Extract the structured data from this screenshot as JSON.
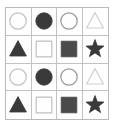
{
  "figure": {
    "name": "shape-grid",
    "rows": 4,
    "columns": 4,
    "background_color": "#fefefe",
    "border_color": "#b9b9b9",
    "gridline_color": "#c2c2c2"
  },
  "palette": {
    "dark_fill": "#3a3a3a",
    "medium_fill": "#4a4a4a",
    "light_outline": "#c0c0c0",
    "medium_outline": "#9a9a9a",
    "very_light_outline": "#cfcfcf"
  },
  "chart_data": {
    "type": "table",
    "title": "",
    "rows": 4,
    "columns": 4,
    "cells": [
      [
        {
          "shape": "circle",
          "style": "outline",
          "color": "#c0c0c0",
          "icon": "circle-outline-icon"
        },
        {
          "shape": "circle",
          "style": "filled",
          "color": "#3a3a3a",
          "icon": "circle-filled-icon"
        },
        {
          "shape": "circle",
          "style": "outline",
          "color": "#9a9a9a",
          "icon": "circle-ring-icon"
        },
        {
          "shape": "triangle",
          "style": "outline",
          "color": "#cfcfcf",
          "icon": "triangle-outline-icon"
        }
      ],
      [
        {
          "shape": "triangle",
          "style": "filled",
          "color": "#3a3a3a",
          "icon": "triangle-filled-icon"
        },
        {
          "shape": "square",
          "style": "outline",
          "color": "#c0c0c0",
          "icon": "square-outline-icon"
        },
        {
          "shape": "square",
          "style": "filled",
          "color": "#4a4a4a",
          "icon": "square-filled-icon"
        },
        {
          "shape": "star",
          "style": "filled",
          "color": "#3a3a3a",
          "icon": "star-filled-icon"
        }
      ],
      [
        {
          "shape": "circle",
          "style": "outline",
          "color": "#c0c0c0",
          "icon": "circle-outline-icon"
        },
        {
          "shape": "circle",
          "style": "filled",
          "color": "#3a3a3a",
          "icon": "circle-filled-icon"
        },
        {
          "shape": "circle",
          "style": "outline",
          "color": "#9a9a9a",
          "icon": "circle-ring-icon"
        },
        {
          "shape": "triangle",
          "style": "outline",
          "color": "#cfcfcf",
          "icon": "triangle-outline-icon"
        }
      ],
      [
        {
          "shape": "triangle",
          "style": "filled",
          "color": "#3a3a3a",
          "icon": "triangle-filled-icon"
        },
        {
          "shape": "square",
          "style": "outline",
          "color": "#c0c0c0",
          "icon": "square-outline-icon"
        },
        {
          "shape": "square",
          "style": "filled",
          "color": "#4a4a4a",
          "icon": "square-filled-icon"
        },
        {
          "shape": "star",
          "style": "filled",
          "color": "#3a3a3a",
          "icon": "star-filled-icon"
        }
      ]
    ]
  }
}
